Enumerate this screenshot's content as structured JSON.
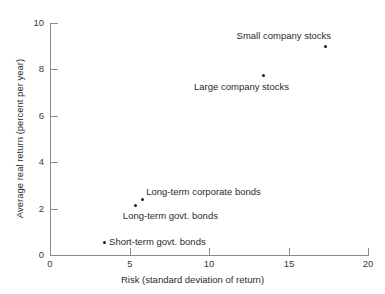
{
  "chart_data": {
    "type": "scatter",
    "title": "",
    "xlabel": "Risk (standard deviation of return)",
    "ylabel": "Average real return (percent per year)",
    "xlim": [
      0,
      20
    ],
    "ylim": [
      0,
      10
    ],
    "xticks": [
      "0",
      "5",
      "10",
      "15",
      "20"
    ],
    "yticks": [
      "0",
      "2",
      "4",
      "6",
      "8",
      "10"
    ],
    "grid": false,
    "legend": "none",
    "point_color": "#1c1c1c",
    "axis_color": "#8a8a8a",
    "points": [
      {
        "label": "Small company stocks",
        "x": 17.3,
        "y": 9.0,
        "label_pos": "above-left"
      },
      {
        "label": "Large company stocks",
        "x": 13.4,
        "y": 7.75,
        "label_pos": "below-left"
      },
      {
        "label": "Long-term corporate bonds",
        "x": 5.8,
        "y": 2.4,
        "label_pos": "above-right"
      },
      {
        "label": "Long-term govt. bonds",
        "x": 5.4,
        "y": 2.15,
        "label_pos": "below-right"
      },
      {
        "label": "Short-term govt. bonds",
        "x": 3.4,
        "y": 0.55,
        "label_pos": "right"
      }
    ]
  },
  "axis": {
    "x_title": "Risk (standard deviation of return)",
    "y_title": "Average real return (percent per year)",
    "x_tick_labels": [
      "0",
      "5",
      "10",
      "15",
      "20"
    ],
    "y_tick_labels": [
      "0",
      "2",
      "4",
      "6",
      "8",
      "10"
    ]
  }
}
